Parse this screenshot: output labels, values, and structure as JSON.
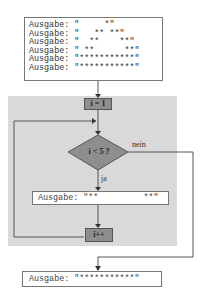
{
  "top_output": {
    "lines": [
      "Ausgabe: \"     *\"",
      "Ausgabe: \"   ** **\"",
      "Ausgabe: \"  **    **\"",
      "Ausgabe: \" **      **\"",
      "Ausgabe: \"***********\"",
      "Ausgabe: \"***********\""
    ]
  },
  "flowchart": {
    "init": "i = 1",
    "condition": "i < 5 ?",
    "yes_label": "ja",
    "no_label": "nein",
    "loop_output": "Ausgabe: \"**         **\"",
    "increment": "i++"
  },
  "bottom_output": {
    "line": "Ausgabe: \"***********\""
  },
  "colors": {
    "loop_background": "#d9d9d9",
    "process_fill": "#8e8e8e",
    "line": "#555555"
  }
}
